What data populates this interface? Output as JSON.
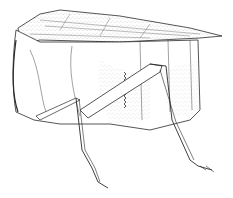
{
  "image": {
    "subject": "insect-illustration",
    "style": "stippled pen-and-ink line drawing",
    "background": "#ffffff",
    "ink": "#2a2a2a"
  }
}
